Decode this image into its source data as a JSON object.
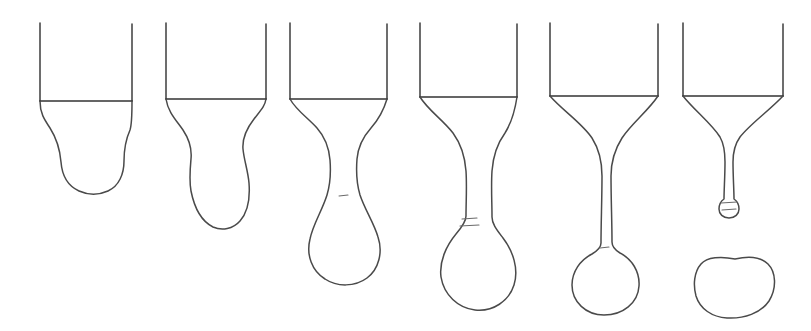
{
  "figure": {
    "background_color": "#ffffff",
    "line_color": "#3a3a3a",
    "liquid_line_color": "#4a4a4a",
    "tick_color": "#6a6a6a",
    "canvas": {
      "width": 811,
      "height": 331
    },
    "stage_count": 6
  },
  "stages": [
    {
      "id": "stage-1",
      "label": "Stage 1",
      "caption": "Liquid bulges below the nozzle as a wide rounded mass",
      "tube": {
        "left_x": 40,
        "right_x": 132,
        "top_y": 23,
        "nozzle_y": 101,
        "left_wall_path": "M40,23 L40,101",
        "right_wall_path": "M132,24 L132,101",
        "nozzle_path": "M40,101 L132,101"
      },
      "liquid": {
        "path": "M40,101 C40,113 44,119 50,128 C57,139 60,150 61,162 C62,175 68,186 79,191 C88,195 99,195 108,191 C119,186 124,174 124,161 C124,150 126,139 130,130 C132,124 132,110 132,101",
        "bottom_y": 191,
        "max_width_x": [
          50,
          130
        ]
      },
      "ticks": []
    },
    {
      "id": "stage-2",
      "label": "Stage 2",
      "caption": "A waist begins to form; the drop hangs as an elongated bulb",
      "tube": {
        "left_x": 166,
        "right_x": 266,
        "top_y": 23,
        "nozzle_y": 99,
        "left_wall_path": "M166,23 L166,99",
        "right_wall_path": "M266,24 L266,99",
        "nozzle_path": "M166,99 L266,99"
      },
      "liquid": {
        "path": "M166,99 C168,112 176,120 183,130 C189,139 192,149 191,159 C190,170 189,180 191,191 C194,206 201,221 213,227 C222,231 233,229 240,221 C249,211 250,196 249,183 C248,171 244,160 243,149 C242,137 247,128 254,119 C261,110 265,106 266,99",
        "bottom_y": 229,
        "waist_y": 160,
        "bulb_x": [
          190,
          250
        ]
      },
      "ticks": []
    },
    {
      "id": "stage-3",
      "label": "Stage 3",
      "caption": "A distinct neck develops above a growing pear-shaped drop",
      "tube": {
        "left_x": 290,
        "right_x": 387,
        "top_y": 23,
        "nozzle_y": 99,
        "left_wall_path": "M290,23 L290,99",
        "right_wall_path": "M387,24 L387,99",
        "nozzle_path": "M290,99 L387,99"
      },
      "liquid": {
        "path": "M290,99 C296,110 308,118 317,128 C325,137 329,148 330,160 C331,173 330,185 327,195 C322,211 313,224 310,239 C306,255 312,271 325,279 C337,287 355,287 367,278 C379,269 383,252 378,237 C374,223 365,210 360,195 C357,185 356,172 357,159 C358,147 363,137 371,128 C379,119 384,109 387,99",
        "bottom_y": 284,
        "neck_y": 196,
        "neck_x": [
          330,
          357
        ],
        "bulb_x": [
          304,
          383
        ]
      },
      "ticks": [
        {
          "path": "M339,196 L348,195"
        }
      ]
    },
    {
      "id": "stage-4",
      "label": "Stage 4",
      "caption": "The neck thins into a slender thread; the drop becomes nearly round",
      "tube": {
        "left_x": 420,
        "right_x": 517,
        "top_y": 23,
        "nozzle_y": 97,
        "left_wall_path": "M420,23 L420,97",
        "right_wall_path": "M517,24 L517,97",
        "nozzle_path": "M420,97 L517,97"
      },
      "liquid": {
        "path": "M420,97 C428,110 443,120 453,133 C461,144 465,157 466,171 C467,186 466,202 466,216 C466,221 462,227 456,234 C446,246 439,262 441,277 C444,295 458,308 475,310 C493,312 509,301 514,285 C519,269 513,251 503,238 C497,230 492,224 492,217 C492,202 491,186 492,171 C493,157 497,144 505,133 C512,122 515,110 517,97",
        "bottom_y": 311,
        "neck_y": 222,
        "neck_x": [
          466,
          492
        ],
        "bulb_x": [
          438,
          519
        ]
      },
      "ticks": [
        {
          "path": "M462,219 L477,218"
        },
        {
          "path": "M460,226 L479,225"
        }
      ]
    },
    {
      "id": "stage-5",
      "label": "Stage 5",
      "caption": "A long thin thread suspends an almost spherical drop just before pinch-off",
      "tube": {
        "left_x": 550,
        "right_x": 658,
        "top_y": 23,
        "nozzle_y": 96,
        "left_wall_path": "M550,23 L550,96",
        "right_wall_path": "M658,24 L658,96",
        "nozzle_path": "M550,96 L658,96"
      },
      "liquid": {
        "path": "M550,96 C562,110 582,123 592,138 C599,149 602,162 602,176 C602,198 601,224 601,243 C601,248 597,251 592,254 C580,260 572,272 572,285 C572,302 586,315 604,315 C623,315 638,303 639,286 C640,272 632,259 620,253 C615,250 612,247 612,242 C612,223 611,198 611,176 C611,162 615,149 622,138 C632,123 648,111 658,96",
        "bottom_y": 315,
        "thread_y": [
          176,
          245
        ],
        "thread_x": [
          601,
          612
        ],
        "sphere_center": [
          606,
          281
        ],
        "sphere_radius": 34
      },
      "ticks": [
        {
          "path": "M600,248 L609,247"
        }
      ]
    },
    {
      "id": "stage-6",
      "label": "Stage 6",
      "caption": "The thread has pinched off and retracted; the free drop falls away",
      "tube": {
        "left_x": 683,
        "right_x": 783,
        "top_y": 23,
        "nozzle_y": 96,
        "left_wall_path": "M683,23 L683,96",
        "right_wall_path": "M783,24 L783,96",
        "nozzle_path": "M683,96 L783,96"
      },
      "liquid": {
        "path": "M683,96 C694,110 712,124 720,137 C724,144 725,152 725,162 C725,176 724,190 724,199 C721,201 719,205 719,209 C719,214 723,218 729,218 C735,218 739,214 739,209 C739,205 737,201 734,199 C734,190 733,176 733,162 C733,152 735,144 740,137 C750,124 770,110 783,96",
        "retracted_tip_y": 218,
        "tip_x": [
          719,
          739
        ]
      },
      "ticks": [
        {
          "path": "M721,203 L737,202"
        },
        {
          "path": "M722,210 L736,209"
        }
      ],
      "detached_drop": {
        "path": "M735,259 C721,256 707,257 701,264 C694,272 693,285 696,296 C700,309 712,317 727,318 C744,319 761,313 769,301 C777,288 776,272 768,264 C760,256 748,256 735,259 Z",
        "center": [
          735,
          288
        ],
        "width": 79,
        "height": 60,
        "top_y": 258,
        "bottom_y": 318
      }
    }
  ]
}
